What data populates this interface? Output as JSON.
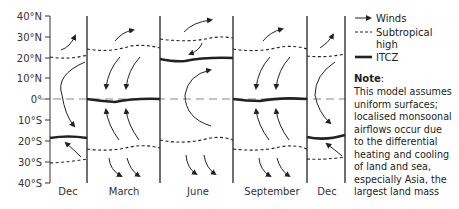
{
  "diagram": {
    "latitude_labels": [
      "40°N",
      "30°N",
      "20°N",
      "10°N",
      "0°",
      "10°S",
      "20°S",
      "30°S",
      "40°S"
    ],
    "months": [
      "Dec",
      "March",
      "June",
      "September",
      "Dec"
    ],
    "legend": {
      "winds": "Winds",
      "subtropical_high_line1": "Subtropical",
      "subtropical_high_line2": "high",
      "itcz": "ITCZ"
    },
    "note": {
      "title": "Note",
      "title_suffix": ":",
      "lines": [
        "This model assumes",
        "uniform surfaces;",
        "localised monsoonal",
        "airflows occur due",
        "to the differential",
        "heating and cooling",
        "of land and sea,",
        "especially Asia, the",
        "largest land mass"
      ]
    },
    "itcz_latitude_by_month": {
      "Dec": -18,
      "March": 0,
      "June": 19,
      "September": 0
    },
    "subtropical_high_latitude_by_month": {
      "Dec": [
        20,
        -29
      ],
      "March": [
        23,
        -24
      ],
      "June": [
        28,
        -19
      ],
      "September": [
        24,
        -23
      ]
    },
    "colors": {
      "line": "#222222",
      "equator": "#888888"
    }
  }
}
